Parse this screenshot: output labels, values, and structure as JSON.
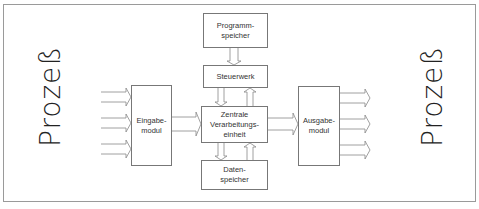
{
  "diagram": {
    "left_label": "Prozeß",
    "right_label": "Prozeß",
    "boxes": {
      "programmspeicher": "Programm-\nspeicher",
      "steuerwerk": "Steuerwerk",
      "zentrale": "Zentrale\nVerarbeitungs-\neinheit",
      "datenspeicher": "Daten-\nspeicher",
      "eingabe": "Eingabe-\nmodul",
      "ausgabe": "Ausgabe-\nmodul"
    },
    "colors": {
      "line": "#777777",
      "frame": "#9a9a9a",
      "text": "#222222"
    }
  }
}
